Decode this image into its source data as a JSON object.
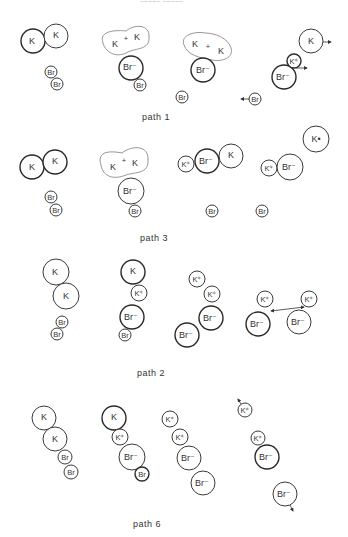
{
  "header": {
    "text": "~~~~~ ~~~~~"
  },
  "labels": {
    "K": "K",
    "K_plus": "K⁺",
    "K_radical": "K•",
    "Br": "Br",
    "Br_minus": "Br⁻",
    "plus": "+"
  },
  "panels": [
    {
      "name": "path-1",
      "label": "path 1"
    },
    {
      "name": "path-3",
      "label": "path 3"
    },
    {
      "name": "path-2",
      "label": "path 2"
    },
    {
      "name": "path-6",
      "label": "path 6"
    }
  ],
  "colors": {
    "line": "#333333",
    "blob_outline": "#8a8a8a",
    "background": "#ffffff"
  }
}
